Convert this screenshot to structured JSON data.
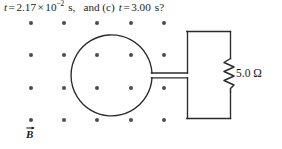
{
  "figure": {
    "caption_line": {
      "full_text": "t = 2.17 × 10^-2 s,  and (c) t = 3.00 s?",
      "var_1": "t",
      "eq_1": "=",
      "value_1": "2.17",
      "times": "×",
      "base": "10",
      "exponent": "−2",
      "unit_1": "s,",
      "conjunction": "and (c)",
      "var_2": "t",
      "eq_2": "=",
      "value_2": "3.00",
      "unit_2": "s?"
    },
    "magnetic_field": {
      "label": "B",
      "direction_note": "out-of-page",
      "dot_marker": "•",
      "grid_columns": 5,
      "grid_rows": 4,
      "dot_color": "#4d4d4d"
    },
    "circuit": {
      "loop_shape": "circle",
      "line_color": "#2b2b2b",
      "resistor": {
        "value": "5.0",
        "unit": "Ω",
        "label": "5.0 Ω"
      }
    }
  }
}
